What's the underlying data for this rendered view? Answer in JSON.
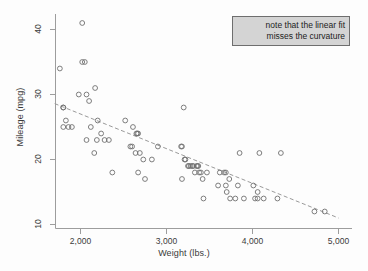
{
  "chart_data": {
    "type": "scatter",
    "title": "",
    "xlabel": "Weight (lbs.)",
    "ylabel": "Mileage (mpg)",
    "xlim": [
      1700,
      5000
    ],
    "ylim": [
      9,
      42
    ],
    "xticks": [
      2000,
      3000,
      4000,
      5000
    ],
    "xticklabels": [
      "2,000",
      "3,000",
      "4,000",
      "5,000"
    ],
    "yticks": [
      10,
      20,
      30,
      40
    ],
    "yticklabels": [
      "10",
      "20",
      "30",
      "40"
    ],
    "grid": false,
    "legend": "none",
    "marker": "open-circle",
    "marker_color": "#6f6f6f",
    "points": [
      [
        1760,
        34
      ],
      [
        1800,
        28
      ],
      [
        1800,
        28
      ],
      [
        1830,
        26
      ],
      [
        1800,
        25
      ],
      [
        1860,
        25
      ],
      [
        1900,
        25
      ],
      [
        1980,
        30
      ],
      [
        2020,
        41
      ],
      [
        2020,
        35
      ],
      [
        2050,
        35
      ],
      [
        2070,
        23
      ],
      [
        2070,
        30
      ],
      [
        2100,
        29
      ],
      [
        2120,
        25
      ],
      [
        2160,
        21
      ],
      [
        2170,
        31
      ],
      [
        2190,
        23
      ],
      [
        2200,
        26
      ],
      [
        2240,
        24
      ],
      [
        2280,
        23
      ],
      [
        2330,
        23
      ],
      [
        2370,
        18
      ],
      [
        2520,
        26
      ],
      [
        2580,
        22
      ],
      [
        2600,
        22
      ],
      [
        2610,
        25
      ],
      [
        2640,
        21
      ],
      [
        2650,
        24
      ],
      [
        2660,
        24
      ],
      [
        2670,
        24
      ],
      [
        2670,
        18
      ],
      [
        2690,
        21
      ],
      [
        2730,
        20
      ],
      [
        2750,
        17
      ],
      [
        2830,
        20
      ],
      [
        2900,
        22
      ],
      [
        3170,
        22
      ],
      [
        3180,
        22
      ],
      [
        3180,
        17
      ],
      [
        3200,
        28
      ],
      [
        3210,
        20
      ],
      [
        3220,
        20
      ],
      [
        3250,
        19
      ],
      [
        3260,
        19
      ],
      [
        3280,
        19
      ],
      [
        3300,
        19
      ],
      [
        3310,
        19
      ],
      [
        3330,
        18
      ],
      [
        3350,
        19
      ],
      [
        3360,
        19
      ],
      [
        3370,
        19
      ],
      [
        3380,
        18
      ],
      [
        3400,
        18
      ],
      [
        3420,
        17
      ],
      [
        3430,
        14
      ],
      [
        3470,
        18
      ],
      [
        3600,
        16
      ],
      [
        3620,
        18
      ],
      [
        3670,
        18
      ],
      [
        3690,
        18
      ],
      [
        3690,
        16
      ],
      [
        3700,
        15
      ],
      [
        3730,
        17
      ],
      [
        3740,
        14
      ],
      [
        3800,
        14
      ],
      [
        3830,
        16
      ],
      [
        3850,
        21
      ],
      [
        3900,
        14
      ],
      [
        4010,
        16
      ],
      [
        4030,
        14
      ],
      [
        4060,
        14
      ],
      [
        4060,
        15
      ],
      [
        4080,
        21
      ],
      [
        4130,
        14
      ],
      [
        4290,
        14
      ],
      [
        4330,
        21
      ],
      [
        4720,
        12
      ],
      [
        4840,
        12
      ]
    ],
    "fit": {
      "type": "linear",
      "x_start": 1700,
      "y_start": 28.6,
      "x_end": 5000,
      "y_end": 11.0,
      "style": "dashed",
      "color": "#9a9a9a"
    }
  },
  "annotation": {
    "line1": "note that the linear fit",
    "line2": "misses the curvature",
    "background": "#d4d4d4",
    "border_color": "#6e6e6e"
  }
}
